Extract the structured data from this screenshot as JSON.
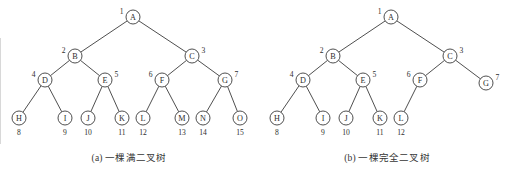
{
  "figure": {
    "background_color": "#ffffff",
    "stroke_color": "#3b3b3b",
    "text_color": "#2e2e2e",
    "node_radius": 7
  },
  "panels": [
    {
      "id": "a",
      "caption": "(a) 一棵满二叉树",
      "nodes": [
        {
          "label": "A",
          "index": "1",
          "x": 133,
          "y": 17,
          "index_pos": "left"
        },
        {
          "label": "B",
          "index": "2",
          "x": 75,
          "y": 56,
          "index_pos": "left"
        },
        {
          "label": "C",
          "index": "3",
          "x": 192,
          "y": 56,
          "index_pos": "right"
        },
        {
          "label": "D",
          "index": "4",
          "x": 45,
          "y": 80,
          "index_pos": "left"
        },
        {
          "label": "E",
          "index": "5",
          "x": 105,
          "y": 80,
          "index_pos": "right"
        },
        {
          "label": "F",
          "index": "6",
          "x": 162,
          "y": 80,
          "index_pos": "left"
        },
        {
          "label": "G",
          "index": "7",
          "x": 225,
          "y": 80,
          "index_pos": "right"
        },
        {
          "label": "H",
          "index": "8",
          "x": 19,
          "y": 118,
          "index_pos": "below"
        },
        {
          "label": "I",
          "index": "9",
          "x": 65,
          "y": 118,
          "index_pos": "below"
        },
        {
          "label": "J",
          "index": "10",
          "x": 88,
          "y": 118,
          "index_pos": "below"
        },
        {
          "label": "K",
          "index": "11",
          "x": 122,
          "y": 118,
          "index_pos": "below"
        },
        {
          "label": "L",
          "index": "12",
          "x": 143,
          "y": 118,
          "index_pos": "below"
        },
        {
          "label": "M",
          "index": "13",
          "x": 182,
          "y": 118,
          "index_pos": "below"
        },
        {
          "label": "N",
          "index": "14",
          "x": 203,
          "y": 118,
          "index_pos": "below"
        },
        {
          "label": "O",
          "index": "15",
          "x": 240,
          "y": 118,
          "index_pos": "below"
        }
      ],
      "edges": [
        [
          "A",
          "B"
        ],
        [
          "A",
          "C"
        ],
        [
          "B",
          "D"
        ],
        [
          "B",
          "E"
        ],
        [
          "C",
          "F"
        ],
        [
          "C",
          "G"
        ],
        [
          "D",
          "H"
        ],
        [
          "D",
          "I"
        ],
        [
          "E",
          "J"
        ],
        [
          "E",
          "K"
        ],
        [
          "F",
          "L"
        ],
        [
          "F",
          "M"
        ],
        [
          "G",
          "N"
        ],
        [
          "G",
          "O"
        ]
      ]
    },
    {
      "id": "b",
      "caption": "(b) 一棵完全二叉树",
      "nodes": [
        {
          "label": "A",
          "index": "1",
          "x": 133,
          "y": 17,
          "index_pos": "left"
        },
        {
          "label": "B",
          "index": "2",
          "x": 75,
          "y": 56,
          "index_pos": "left"
        },
        {
          "label": "C",
          "index": "3",
          "x": 192,
          "y": 56,
          "index_pos": "right"
        },
        {
          "label": "D",
          "index": "4",
          "x": 45,
          "y": 80,
          "index_pos": "left"
        },
        {
          "label": "E",
          "index": "5",
          "x": 105,
          "y": 80,
          "index_pos": "right"
        },
        {
          "label": "F",
          "index": "6",
          "x": 162,
          "y": 80,
          "index_pos": "left"
        },
        {
          "label": "G",
          "index": "7",
          "x": 228,
          "y": 83,
          "index_pos": "right"
        },
        {
          "label": "H",
          "index": "8",
          "x": 19,
          "y": 118,
          "index_pos": "below"
        },
        {
          "label": "I",
          "index": "9",
          "x": 65,
          "y": 118,
          "index_pos": "below"
        },
        {
          "label": "J",
          "index": "10",
          "x": 88,
          "y": 118,
          "index_pos": "below"
        },
        {
          "label": "K",
          "index": "11",
          "x": 122,
          "y": 118,
          "index_pos": "below"
        },
        {
          "label": "L",
          "index": "12",
          "x": 143,
          "y": 118,
          "index_pos": "below"
        }
      ],
      "edges": [
        [
          "A",
          "B"
        ],
        [
          "A",
          "C"
        ],
        [
          "B",
          "D"
        ],
        [
          "B",
          "E"
        ],
        [
          "C",
          "F"
        ],
        [
          "C",
          "G"
        ],
        [
          "D",
          "H"
        ],
        [
          "D",
          "I"
        ],
        [
          "E",
          "J"
        ],
        [
          "E",
          "K"
        ],
        [
          "F",
          "L"
        ]
      ]
    }
  ]
}
